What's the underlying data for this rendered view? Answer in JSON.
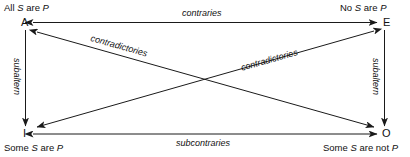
{
  "diagram": {
    "vertices": [
      {
        "letter": "A",
        "proposition_prefix": "All ",
        "proposition_subject": "S",
        "proposition_mid": " are ",
        "proposition_predicate": "P",
        "proposition_full": "All S are P",
        "position": "top-left"
      },
      {
        "letter": "E",
        "proposition_prefix": "No ",
        "proposition_subject": "S",
        "proposition_mid": " are ",
        "proposition_predicate": "P",
        "proposition_full": "No S are P",
        "position": "top-right"
      },
      {
        "letter": "I",
        "proposition_prefix": "Some ",
        "proposition_subject": "S",
        "proposition_mid": " are ",
        "proposition_predicate": "P",
        "proposition_full": "Some S are P",
        "position": "bottom-left"
      },
      {
        "letter": "O",
        "proposition_prefix": "Some ",
        "proposition_subject": "S",
        "proposition_mid": " are not ",
        "proposition_predicate": "P",
        "proposition_full": "Some S are not P",
        "position": "bottom-right"
      }
    ],
    "relations": [
      {
        "id": "contraries",
        "label": "contraries",
        "from": "A",
        "to": "E",
        "edge": "top",
        "arrows": "both"
      },
      {
        "id": "subcontraries",
        "label": "subcontraries",
        "from": "I",
        "to": "O",
        "edge": "bottom",
        "arrows": "both"
      },
      {
        "id": "subaltern-left",
        "label": "subaltern",
        "from": "A",
        "to": "I",
        "edge": "left",
        "arrows": "down"
      },
      {
        "id": "subaltern-right",
        "label": "subaltern",
        "from": "E",
        "to": "O",
        "edge": "right",
        "arrows": "down"
      },
      {
        "id": "contradictories-a-o",
        "label": "contradictories",
        "from": "A",
        "to": "O",
        "edge": "diagonal-down",
        "arrows": "both"
      },
      {
        "id": "contradictories-e-i",
        "label": "contradictories",
        "from": "E",
        "to": "I",
        "edge": "diagonal-up",
        "arrows": "both"
      }
    ],
    "colors": {
      "stroke": "#1a1a1a",
      "text": "#111111",
      "background": "#ffffff"
    }
  }
}
